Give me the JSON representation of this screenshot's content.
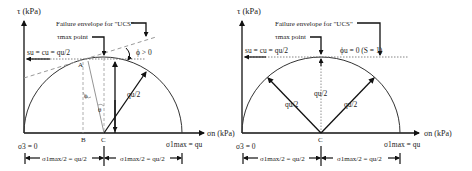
{
  "left_diagram": {
    "y_axis_label": "τ (kPa)",
    "x_axis_label": "σn (kPa)",
    "failure_envelope_label": "Failure envelope for \"UCS\"",
    "tau_max_label": "τmax point",
    "shear_strength_label": "su = cu = qu/2",
    "phi_label": "ϕ > 0",
    "point_A": "A",
    "point_B": "B",
    "point_C": "C",
    "angle_phi": "ϕ",
    "angle_theta": "θ",
    "radius_label": "qu/2",
    "sigma3_label": "σ3 = 0",
    "sigma1_label": "σ1max = qu",
    "dim_left": "σ1max/2 = qu/2",
    "dim_right": "σ1max/2 = qu/2"
  },
  "right_diagram": {
    "y_axis_label": "τ (kPa)",
    "x_axis_label": "σn (kPa)",
    "failure_envelope_label": "Failure envelope for \"UCS\"",
    "tau_max_label": "τmax point",
    "shear_strength_label": "su = cu = qu/2",
    "phi_label": "ϕu = 0 (S = 1)",
    "point_C": "C",
    "radius_left": "qu/2",
    "radius_center": "qu/2",
    "radius_right": "qu/2",
    "sigma3_label": "σ3 = 0",
    "sigma1_label": "σ1max = qu",
    "dim_left": "σ1max/2 = qu/2",
    "dim_right": "σ1max/2 = qu/2"
  }
}
